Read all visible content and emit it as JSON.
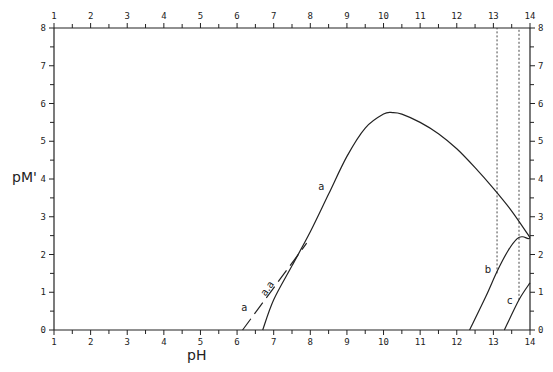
{
  "chart_data": {
    "type": "line",
    "title": "",
    "xlabel": "pH",
    "ylabel": "pM'",
    "xlim": [
      1,
      14
    ],
    "ylim": [
      0,
      8
    ],
    "x_ticks": [
      1,
      2,
      3,
      4,
      5,
      6,
      7,
      8,
      9,
      10,
      11,
      12,
      13,
      14
    ],
    "y_ticks": [
      0,
      1,
      2,
      3,
      4,
      5,
      6,
      7,
      8
    ],
    "grid": false,
    "legend": null,
    "series": [
      {
        "name": "a",
        "style": "solid",
        "points": [
          [
            6.7,
            0
          ],
          [
            7.0,
            0.8
          ],
          [
            7.5,
            1.7
          ],
          [
            8.0,
            2.6
          ],
          [
            8.5,
            3.6
          ],
          [
            9.0,
            4.6
          ],
          [
            9.5,
            5.35
          ],
          [
            10.0,
            5.72
          ],
          [
            10.25,
            5.76
          ],
          [
            10.5,
            5.72
          ],
          [
            11.0,
            5.5
          ],
          [
            11.5,
            5.2
          ],
          [
            12.0,
            4.8
          ],
          [
            12.5,
            4.3
          ],
          [
            13.0,
            3.75
          ],
          [
            13.5,
            3.15
          ],
          [
            14.0,
            2.45
          ]
        ]
      },
      {
        "name": "a (asymptote)",
        "style": "dashed",
        "annotation": "a.a",
        "points": [
          [
            6.15,
            0
          ],
          [
            7.9,
            2.3
          ]
        ]
      },
      {
        "name": "b",
        "style": "solid",
        "points": [
          [
            12.35,
            0
          ],
          [
            12.8,
            0.9
          ],
          [
            13.1,
            1.55
          ],
          [
            13.4,
            2.1
          ],
          [
            13.65,
            2.42
          ],
          [
            13.8,
            2.47
          ],
          [
            13.95,
            2.42
          ],
          [
            14.0,
            2.45
          ]
        ]
      },
      {
        "name": "c",
        "style": "solid",
        "points": [
          [
            13.3,
            0
          ],
          [
            13.7,
            0.8
          ],
          [
            14.0,
            1.25
          ]
        ]
      }
    ],
    "reference_lines": [
      {
        "type": "vertical",
        "style": "dotted",
        "x": 13.1,
        "y_from": 1.5,
        "y_to": 8
      },
      {
        "type": "vertical",
        "style": "dotted",
        "x": 13.7,
        "y_from": 0.8,
        "y_to": 8
      }
    ],
    "annotations": [
      {
        "text": "a",
        "x": 8.3,
        "y": 3.7
      },
      {
        "text": "a",
        "x": 6.2,
        "y": 0.5
      },
      {
        "text": "b",
        "x": 12.85,
        "y": 1.5
      },
      {
        "text": "c",
        "x": 13.45,
        "y": 0.7
      }
    ]
  },
  "labels": {
    "xlabel": "pH",
    "ylabel": "pM'"
  }
}
